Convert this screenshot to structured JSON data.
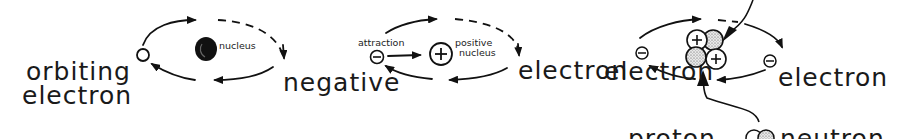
{
  "panels": [
    {
      "id": "orbit",
      "labels": {
        "nucleus": "nucleus",
        "electron_line1": "orbiting",
        "electron_line2": "electron"
      }
    },
    {
      "id": "attraction",
      "labels": {
        "attraction": "attraction",
        "positive_line1": "positive",
        "positive_line2": "nucleus",
        "negative_line1": "negative",
        "negative_line2": "electron",
        "electron_right": "electron",
        "minus_symbol": "−",
        "plus_symbol": "+"
      }
    },
    {
      "id": "nucleus-detail",
      "labels": {
        "electron_left": "electron",
        "electron_right": "electron",
        "proton": "proton",
        "neutron": "neutron",
        "minus_symbol": "−",
        "plus_symbol": "+"
      }
    }
  ],
  "colors": {
    "ink": "#111111",
    "background": "#ffffff"
  }
}
